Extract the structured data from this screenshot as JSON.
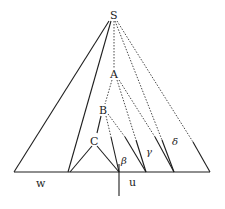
{
  "diagram": {
    "type": "derivation-tree",
    "nodes": {
      "root": "S",
      "a": "A",
      "b": "B",
      "c": "C"
    },
    "substrings": {
      "w": "w",
      "u": "u",
      "beta": "β",
      "gamma": "γ",
      "delta": "δ"
    },
    "colors": {
      "line": "#1e1e1e",
      "background": "#ffffff"
    }
  }
}
